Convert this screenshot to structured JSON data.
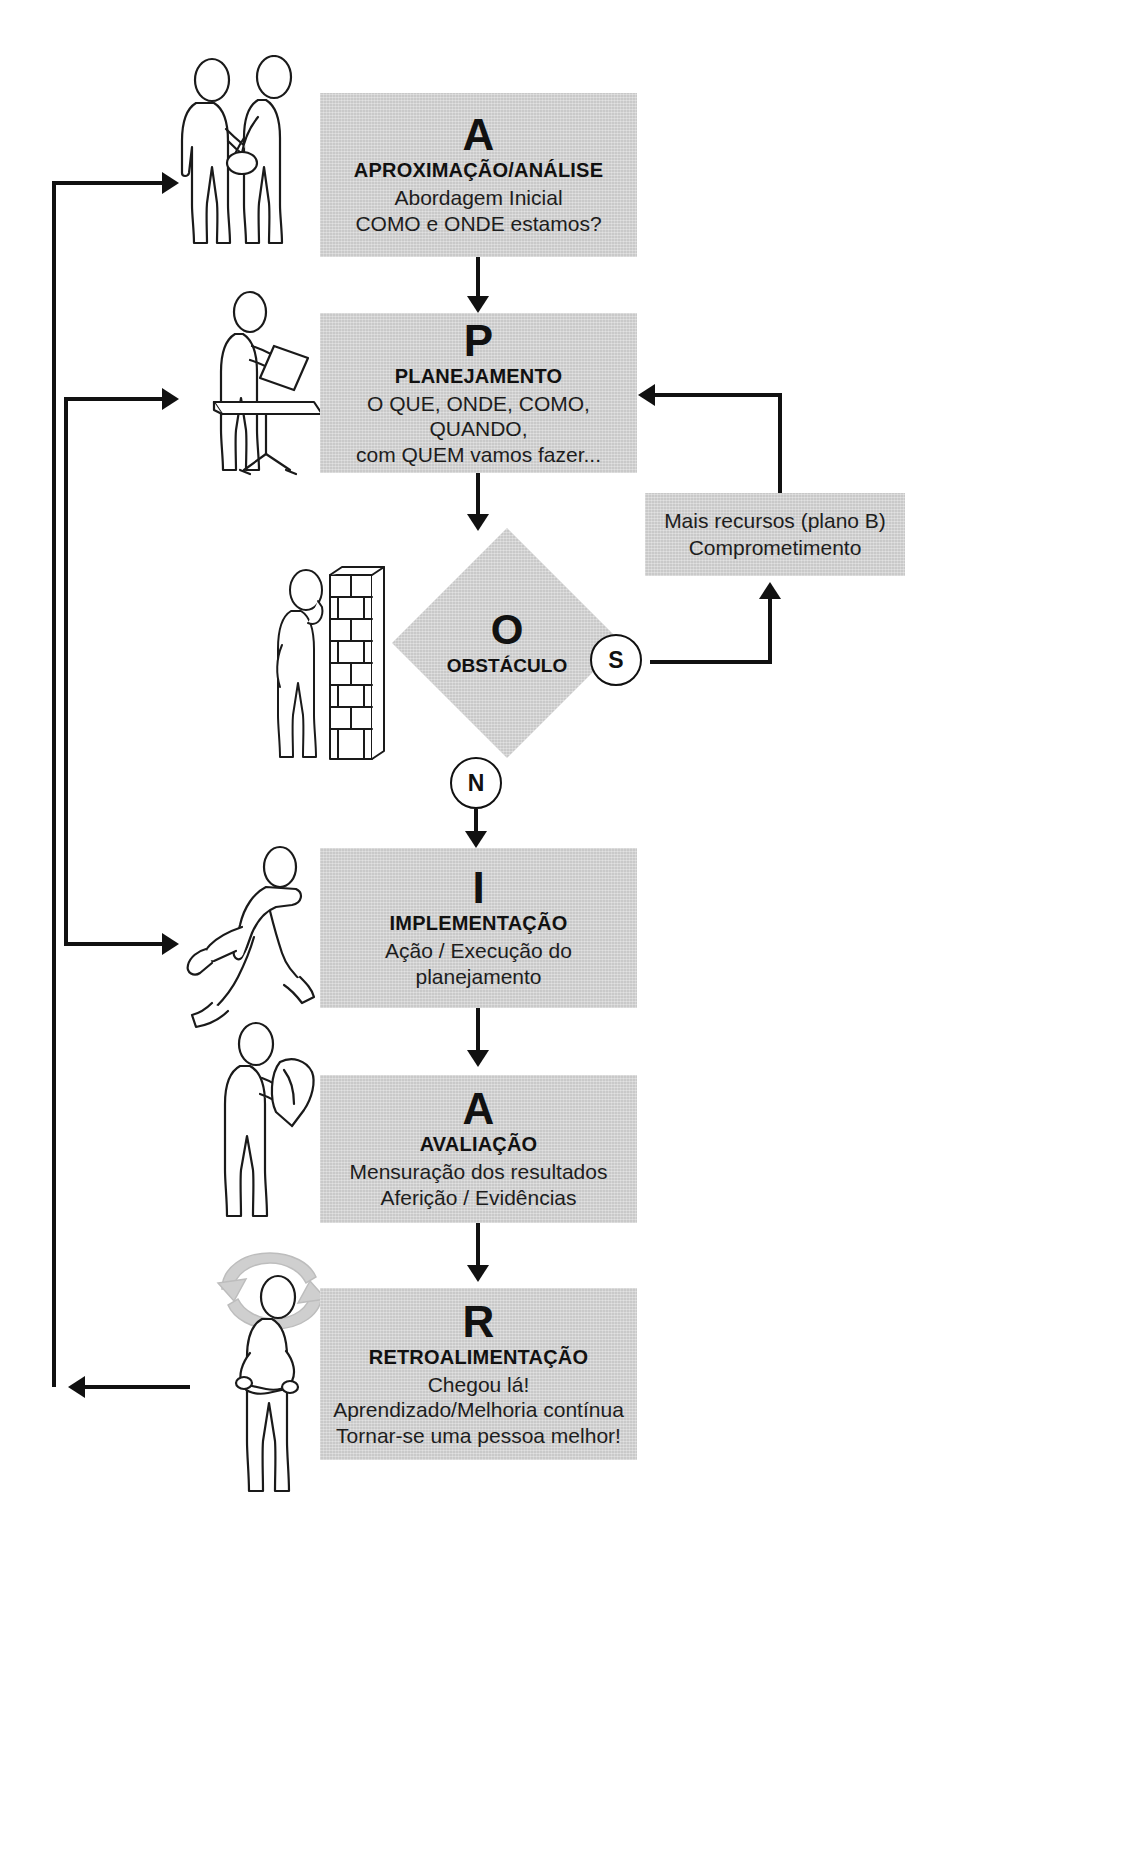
{
  "diagram": {
    "boxes": [
      {
        "id": "aproximacao",
        "letter": "A",
        "title": "APROXIMAÇÃO/ANÁLISE",
        "lines": [
          "Abordagem Inicial",
          "COMO e ONDE estamos?"
        ],
        "icon": "handshake-figure"
      },
      {
        "id": "planejamento",
        "letter": "P",
        "title": "PLANEJAMENTO",
        "lines": [
          "O QUE, ONDE, COMO, QUANDO,",
          "com QUEM vamos fazer..."
        ],
        "icon": "person-at-desk-figure"
      },
      {
        "id": "obstaculo",
        "letter": "O",
        "title": "OBSTÁCULO",
        "lines": [],
        "icon": "person-at-wall-figure"
      },
      {
        "id": "implementacao",
        "letter": "I",
        "title": "IMPLEMENTAÇÃO",
        "lines": [
          "Ação / Execução do",
          "planejamento"
        ],
        "icon": "running-person-figure"
      },
      {
        "id": "avaliacao",
        "letter": "A",
        "title": "AVALIAÇÃO",
        "lines": [
          "Mensuração dos resultados",
          "Aferição / Evidências"
        ],
        "icon": "person-reading-figure"
      },
      {
        "id": "retroalimentacao",
        "letter": "R",
        "title": "RETROALIMENTAÇÃO",
        "lines": [
          "Chegou lá!",
          "Aprendizado/Melhoria contínua",
          "Tornar-se uma pessoa melhor!"
        ],
        "icon": "person-with-arrows-figure"
      }
    ],
    "note": {
      "id": "mais-recursos",
      "lines": [
        "Mais recursos (plano B)",
        "Comprometimento"
      ]
    },
    "decisions": {
      "yes_label": "S",
      "no_label": "N"
    },
    "colors": {
      "box_fill": "#c9c9c9",
      "line": "#111111",
      "text": "#1a1a1a",
      "circle_fill": "#ffffff"
    }
  }
}
